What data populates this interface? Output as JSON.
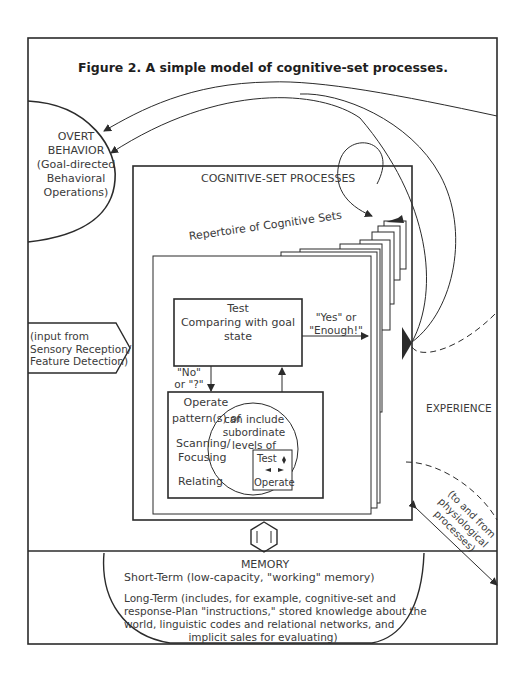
{
  "figure": {
    "title": "Figure 2. A simple model of cognitive-set processes."
  },
  "overt_behavior": {
    "lines": [
      "OVERT",
      "BEHAVIOR",
      "(Goal-directed",
      "Behavioral",
      "Operations)"
    ]
  },
  "cognitive_set_processes": {
    "label": "COGNITIVE-SET PROCESSES",
    "repertoire_label": "Repertoire of Cognitive Sets"
  },
  "input": {
    "lines": [
      "(input from",
      "Sensory Reception/",
      "Feature Detection)"
    ]
  },
  "test_box": {
    "lines": [
      "Test",
      "Comparing with goal",
      "state"
    ]
  },
  "yes_label": {
    "lines": [
      "\"Yes\" or",
      "\"Enough!\""
    ]
  },
  "no_label": {
    "lines": [
      "\"No\"",
      "or \"?\""
    ]
  },
  "operate_box": {
    "title": "Operate",
    "lines": [
      "pattern(s) of",
      "Scanning/",
      "Focusing",
      "Relating"
    ],
    "circle_lines": [
      "can include",
      "subordinate",
      "levels of"
    ],
    "mini_test": "Test",
    "mini_operate": "Operate"
  },
  "experience": {
    "label": "EXPERIENCE"
  },
  "physiological": {
    "lines": [
      "(to and from",
      "physiological",
      "processes)"
    ]
  },
  "memory": {
    "title": "MEMORY",
    "short_term": "Short-Term (low-capacity, \"working\" memory)",
    "long_term_lines": [
      "Long-Term (includes, for example, cognitive-set and",
      "response-Plan \"instructions,\" stored knowledge about the",
      "world, linguistic codes and relational networks, and",
      "implicit sales for evaluating)"
    ]
  },
  "colors": {
    "ink": "#2b2b2b",
    "background": "#ffffff"
  }
}
